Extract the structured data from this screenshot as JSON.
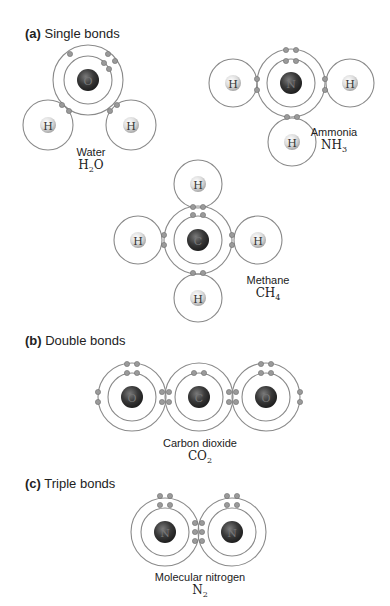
{
  "sections": [
    {
      "id": "a",
      "letter": "(a)",
      "title": "Single bonds"
    },
    {
      "id": "b",
      "letter": "(b)",
      "title": "Double bonds"
    },
    {
      "id": "c",
      "letter": "(c)",
      "title": "Triple bonds"
    }
  ],
  "molecules": {
    "water": {
      "name": "Water",
      "formula_main": "H",
      "formula_sub": "2",
      "formula_tail": "O",
      "atoms": [
        "O",
        "H",
        "H"
      ]
    },
    "ammonia": {
      "name": "Ammonia",
      "formula_main": "NH",
      "formula_sub": "3",
      "atoms": [
        "N",
        "H",
        "H",
        "H"
      ]
    },
    "methane": {
      "name": "Methane",
      "formula_main": "CH",
      "formula_sub": "4",
      "atoms": [
        "C",
        "H",
        "H",
        "H",
        "H"
      ]
    },
    "carbon_dioxide": {
      "name": "Carbon dioxide",
      "formula_main": "CO",
      "formula_sub": "2",
      "atoms": [
        "O",
        "C",
        "O"
      ]
    },
    "nitrogen": {
      "name": "Molecular nitrogen",
      "formula_main": "N",
      "formula_sub": "2",
      "atoms": [
        "N",
        "N"
      ]
    }
  },
  "colors": {
    "heavy_atom": "#3a3a3a",
    "hydrogen_atom": "#e6e6e6",
    "shell": "#8a8a8a",
    "electron": "#9a9a9a"
  }
}
